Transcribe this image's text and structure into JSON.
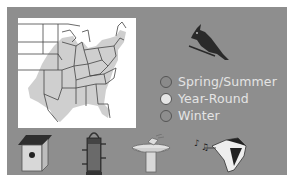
{
  "colors": {
    "panel_bg": "#8e8e8e",
    "map_bg": "#ffffff",
    "range_fill": "#cfcfcf",
    "state_lines": "#444444",
    "legend_text": "#e4e4e4"
  },
  "bird": {
    "icon": "cardinal-icon"
  },
  "legend": {
    "items": [
      {
        "label": "Spring/Summer",
        "color": "#8a8a8a"
      },
      {
        "label": "Year-Round",
        "color": "#e6e6e6"
      },
      {
        "label": "Winter",
        "color": "#8e8e8e"
      }
    ]
  },
  "habitat_icons": [
    {
      "name": "birdhouse-icon"
    },
    {
      "name": "bird-feeder-icon"
    },
    {
      "name": "birdbath-icon"
    },
    {
      "name": "bird-song-icon"
    }
  ]
}
